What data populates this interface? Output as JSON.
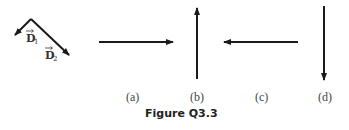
{
  "figure": {
    "caption": "Figure Q3.3",
    "reference_vectors": [
      {
        "name": "D",
        "subscript": "1",
        "direction": "down-left"
      },
      {
        "name": "D",
        "subscript": "2",
        "direction": "down-right"
      }
    ],
    "options": [
      {
        "label": "(a)",
        "direction": "right"
      },
      {
        "label": "(b)",
        "direction": "up"
      },
      {
        "label": "(c)",
        "direction": "left"
      },
      {
        "label": "(d)",
        "direction": "down"
      }
    ],
    "colors": {
      "arrow": "#1a1a1a",
      "text": "#333333"
    }
  }
}
